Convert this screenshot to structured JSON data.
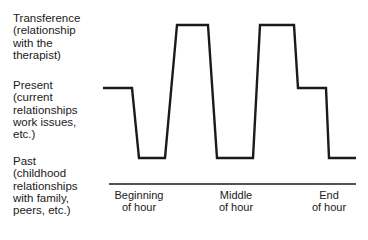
{
  "chart_data": {
    "type": "line",
    "title": "",
    "xlabel": "",
    "ylabel": "",
    "y_levels": [
      "Transference (relationship with the therapist)",
      "Present (current relationships work issues, etc.)",
      "Past (childhood relationships with family, peers, etc.)"
    ],
    "x_ticks": [
      "Beginning of hour",
      "Middle of hour",
      "End of hour"
    ],
    "series": [
      {
        "name": "Focus of session",
        "x": [
          103,
          132,
          139,
          165,
          177,
          208,
          217,
          253,
          260,
          294,
          298,
          326,
          329,
          356
        ],
        "y": [
          88,
          88,
          158,
          158,
          25,
          25,
          158,
          158,
          25,
          25,
          88,
          88,
          158,
          158
        ],
        "levels": [
          "Present",
          "Present",
          "Past",
          "Past",
          "Transference",
          "Transference",
          "Past",
          "Past",
          "Transference",
          "Transference",
          "Present",
          "Present",
          "Past",
          "Past"
        ]
      }
    ],
    "grid": false,
    "legend": "none"
  },
  "labels": {
    "transference": "Transference\n(relationship\nwith the\ntherapist)",
    "present": "Present\n(current\nrelationships\nwork issues,\netc.)",
    "past": "Past\n(childhood\nrelationships\nwith family,\npeers, etc.)"
  },
  "x_axis": {
    "beginning": "Beginning\nof hour",
    "middle": "Middle\nof hour",
    "end": "End\nof hour"
  },
  "colors": {
    "line": "#1a1a1a",
    "axis": "#1a1a1a"
  }
}
